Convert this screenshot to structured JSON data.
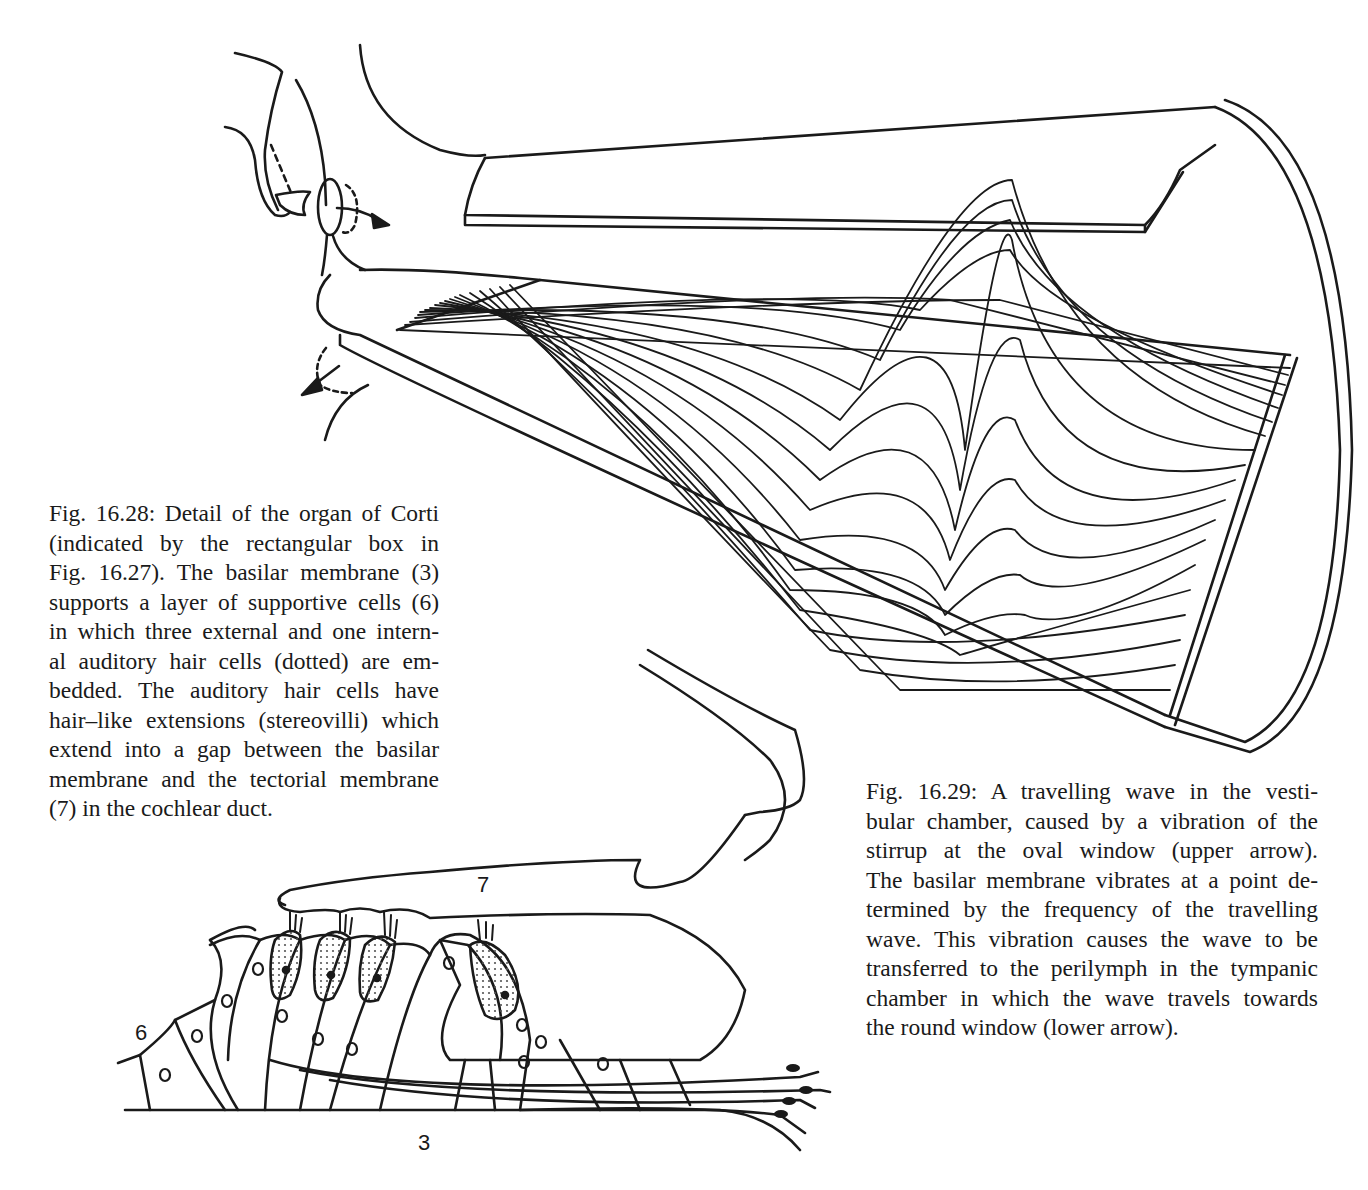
{
  "figures": [
    {
      "id": "fig-16-29",
      "title": "Fig. 16.29",
      "subject": "travelling wave in the cochlea",
      "caption_lines": [
        "Fig. 16.29: A travelling wave in the vesti-",
        "bular chamber, caused by a vibration of the",
        "stirrup at the oval window (upper arrow).",
        "The basilar membrane vibrates at a point de-",
        "termined by the frequency of the travelling",
        "wave. This vibration causes the wave to be",
        "transferred to the perilymph in the tympanic",
        "chamber in which the wave travels towards",
        "the round window (lower arrow)."
      ]
    },
    {
      "id": "fig-16-28",
      "title": "Fig. 16.28",
      "subject": "organ of Corti detail",
      "caption_lines": [
        "Fig. 16.28: Detail of the organ of Corti",
        "(indicated by the rectangular box in",
        "Fig. 16.27). The basilar membrane (3)",
        "supports a layer of supportive cells (6)",
        "in which three external and one intern-",
        "al auditory hair cells (dotted) are em-",
        "bedded. The auditory hair cells have",
        "hair–like extensions (stereovilli) which",
        "extend into a gap between the basilar",
        "membrane and the tectorial membrane",
        "(7) in the cochlear duct."
      ],
      "labels": {
        "tectorial_membrane": "7",
        "supportive_cells": "6",
        "basilar_membrane": "3"
      }
    }
  ],
  "colors": {
    "ink": "#1a1a1a",
    "paper": "#ffffff",
    "stipple": "#555555"
  }
}
